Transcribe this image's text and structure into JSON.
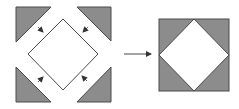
{
  "diagram": {
    "colors": {
      "fill_gray": "#8c8c8c",
      "stroke": "#4a4a4a",
      "background": "#ffffff",
      "diamond_fill": "#ffffff"
    },
    "left_panel": {
      "triangles": [
        {
          "name": "top-left",
          "points": "16,7 51,7 16,42"
        },
        {
          "name": "top-right",
          "points": "77,7 111,7 111,41"
        },
        {
          "name": "bottom-left",
          "points": "16,67 16,102 51,102"
        },
        {
          "name": "bottom-right",
          "points": "111,67 111,102 77,102"
        }
      ],
      "diamond": {
        "points": "63,19 98,54 63,90 28,54"
      },
      "inward_arrows": [
        {
          "name": "arrow-top-left",
          "x1": 38,
          "y1": 27,
          "x2": 43,
          "y2": 32
        },
        {
          "name": "arrow-top-right",
          "x1": 88,
          "y1": 27,
          "x2": 83,
          "y2": 32
        },
        {
          "name": "arrow-bottom-left",
          "x1": 38,
          "y1": 82,
          "x2": 43,
          "y2": 77
        },
        {
          "name": "arrow-bottom-right",
          "x1": 87,
          "y1": 81,
          "x2": 82,
          "y2": 76
        }
      ]
    },
    "transition_arrow": {
      "x1": 124,
      "y1": 54,
      "x2": 150,
      "y2": 54
    },
    "right_panel": {
      "square": {
        "x": 159,
        "y": 19,
        "width": 70,
        "height": 72
      },
      "diamond": {
        "points": "194,19 229,55 194,91 159,55"
      }
    }
  }
}
